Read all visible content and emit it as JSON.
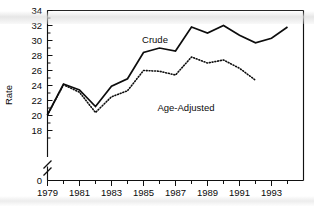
{
  "chart_data": {
    "type": "line",
    "title": "",
    "xlabel": "",
    "ylabel": "Rate",
    "x": [
      1979,
      1980,
      1981,
      1982,
      1983,
      1984,
      1985,
      1986,
      1987,
      1988,
      1989,
      1990,
      1991,
      1992,
      1993,
      1994
    ],
    "xlim": [
      1978.6,
      1994.6
    ],
    "ylim": [
      16.8,
      34
    ],
    "y_axis_break": true,
    "y_break_bottom_value": 0,
    "grid": false,
    "legend": "inline-labels",
    "xticks_major": [
      1979,
      1981,
      1983,
      1985,
      1987,
      1989,
      1991,
      1993
    ],
    "xtick_labels": [
      "1979",
      "1981",
      "1983",
      "1985",
      "1987",
      "1989",
      "1991",
      "1993"
    ],
    "yticks": [
      0,
      18,
      20,
      22,
      24,
      26,
      28,
      30,
      32,
      34
    ],
    "ytick_labels": [
      "0",
      "18",
      "20",
      "22",
      "24",
      "26",
      "28",
      "30",
      "32",
      "34"
    ],
    "series": [
      {
        "name": "Crude",
        "style": "solid",
        "x": [
          1979,
          1980,
          1981,
          1982,
          1983,
          1984,
          1985,
          1986,
          1987,
          1988,
          1989,
          1990,
          1991,
          1992,
          1993,
          1994
        ],
        "values": [
          20.1,
          24.2,
          23.4,
          21.2,
          23.9,
          24.9,
          28.4,
          29.0,
          28.6,
          31.8,
          31.0,
          32.0,
          30.7,
          29.7,
          30.3,
          31.8
        ],
        "label_text": "Crude"
      },
      {
        "name": "Age-Adjusted",
        "style": "dotted",
        "x": [
          1979,
          1980,
          1981,
          1982,
          1983,
          1984,
          1985,
          1986,
          1987,
          1988,
          1989,
          1990,
          1991,
          1992
        ],
        "values": [
          20.1,
          24.1,
          23.1,
          20.4,
          22.5,
          23.3,
          26.0,
          25.9,
          25.4,
          27.8,
          27.0,
          27.4,
          26.3,
          24.7
        ],
        "label_text": "Age-Adjusted"
      }
    ],
    "annotations": [
      {
        "text": "Crude",
        "x": 1984.6,
        "y": 30.6
      },
      {
        "text": "Age-Adjusted",
        "x": 1985.2,
        "y": 24.2
      }
    ]
  },
  "axis": {
    "y_title": "Rate",
    "y_labels": {
      "t34": "34",
      "t32": "32",
      "t30": "30",
      "t28": "28",
      "t26": "26",
      "t24": "24",
      "t22": "22",
      "t20": "20",
      "t18": "18",
      "t0": "0"
    },
    "x_labels": {
      "t1979": "1979",
      "t1981": "1981",
      "t1983": "1983",
      "t1985": "1985",
      "t1987": "1987",
      "t1989": "1989",
      "t1991": "1991",
      "t1993": "1993"
    }
  },
  "labels": {
    "crude": "Crude",
    "age_adjusted": "Age-Adjusted"
  },
  "colors": {
    "line": "#0d0d0d",
    "axis": "#111111",
    "background": "#ffffff"
  }
}
